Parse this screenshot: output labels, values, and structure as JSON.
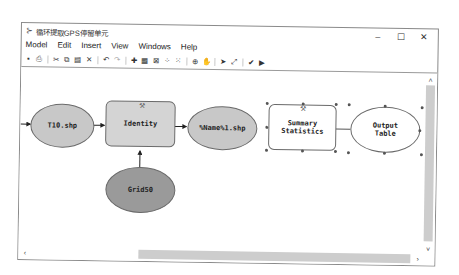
{
  "window": {
    "title": "循环提取GPS停留单元",
    "controls": {
      "minimize": "–",
      "maximize": "☐",
      "close": "✕"
    }
  },
  "menu": [
    "Model",
    "Edit",
    "Insert",
    "View",
    "Windows",
    "Help"
  ],
  "toolbar": [
    {
      "name": "save-icon",
      "glyph": "▪"
    },
    {
      "name": "print-icon",
      "glyph": "⎙"
    },
    {
      "name": "cut-icon",
      "glyph": "✂"
    },
    {
      "name": "copy-icon",
      "glyph": "⧉"
    },
    {
      "name": "paste-icon",
      "glyph": "▤"
    },
    {
      "name": "delete-icon",
      "glyph": "✕"
    },
    {
      "name": "undo-icon",
      "glyph": "↶"
    },
    {
      "name": "redo-icon",
      "glyph": "↷"
    },
    {
      "name": "add-data-icon",
      "glyph": "✚"
    },
    {
      "name": "auto-layout-icon",
      "glyph": "▦"
    },
    {
      "name": "full-extent-icon",
      "glyph": "⊠"
    },
    {
      "name": "fixed-zoom-in-icon",
      "glyph": "⁘"
    },
    {
      "name": "fixed-zoom-out-icon",
      "glyph": "⁙"
    },
    {
      "name": "zoom-in-icon",
      "glyph": "⊕"
    },
    {
      "name": "pan-icon",
      "glyph": "✋"
    },
    {
      "name": "select-icon",
      "glyph": "➤"
    },
    {
      "name": "connect-icon",
      "glyph": "⤢"
    },
    {
      "name": "validate-icon",
      "glyph": "✔"
    },
    {
      "name": "run-icon",
      "glyph": "▶"
    }
  ],
  "nodes": {
    "t10": {
      "label": "T10.shp",
      "color": "#c8c8c8"
    },
    "identity": {
      "label": "Identity",
      "color": "#d4d4d4"
    },
    "output_name": {
      "label": "%Name%1.shp",
      "color": "#c8c8c8"
    },
    "grid50": {
      "label": "Grid50",
      "color": "#9a9a9a"
    },
    "summary": {
      "label": "Summary Statistics",
      "color": "#ffffff"
    },
    "output_table": {
      "label": "Output Table",
      "color": "#ffffff"
    }
  },
  "scrollbars": {
    "up": "˄",
    "down": "˅",
    "left": "‹",
    "right": "›"
  }
}
